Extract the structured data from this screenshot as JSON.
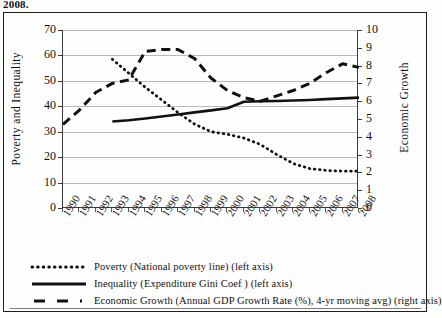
{
  "caption_tail": "2008.",
  "chart_data": {
    "type": "line",
    "title": "",
    "xlabel": "",
    "ylabel": "Poverty and Inequality",
    "y2label": "Economic Growth",
    "grid": true,
    "legend_position": "bottom",
    "x": [
      1990,
      1991,
      1992,
      1993,
      1994,
      1995,
      1996,
      1997,
      1998,
      1999,
      2000,
      2001,
      2002,
      2003,
      2004,
      2005,
      2006,
      2007,
      2008
    ],
    "xticklabels": [
      "1990",
      "1991",
      "1992",
      "1993",
      "1994",
      "1995",
      "1996",
      "1997",
      "1998",
      "1999",
      "2000",
      "2001",
      "2002",
      "2003",
      "2004",
      "2005",
      "2006",
      "2007",
      "2008"
    ],
    "ylim": [
      0,
      70
    ],
    "yticks": [
      0,
      10,
      20,
      30,
      40,
      50,
      60,
      70
    ],
    "y2lim": [
      0,
      10
    ],
    "y2ticks": [
      0,
      1,
      2,
      3,
      4,
      5,
      6,
      7,
      8,
      9,
      10
    ],
    "series": [
      {
        "name": "Poverty (National poverty line) (left axis)",
        "axis": "left",
        "style": "dotted",
        "x": [
          1993,
          1994,
          1995,
          1996,
          1997,
          1998,
          1999,
          2000,
          2001,
          2002,
          2003,
          2004,
          2005,
          2006,
          2007,
          2008
        ],
        "values": [
          58.5,
          53.0,
          47.5,
          42.5,
          37.5,
          33.0,
          30.0,
          29.0,
          27.5,
          25.0,
          21.0,
          17.5,
          15.5,
          14.8,
          14.5,
          14.5
        ]
      },
      {
        "name": "Inequality (Expenditure Gini Coef) (left axis)",
        "axis": "left",
        "style": "solid",
        "x": [
          1993,
          1994,
          1995,
          1996,
          1997,
          1998,
          1999,
          2000,
          2001,
          2002,
          2003,
          2004,
          2005,
          2006,
          2007,
          2008
        ],
        "values": [
          34.0,
          34.5,
          35.2,
          36.0,
          36.8,
          37.6,
          38.4,
          39.2,
          41.8,
          42.0,
          42.1,
          42.3,
          42.5,
          42.8,
          43.1,
          43.4
        ]
      },
      {
        "name": "Economic Growth (Annual GDP Growth Rate (%), 4-yr moving avg) (right axis)",
        "axis": "right",
        "style": "dashed",
        "x": [
          1990,
          1991,
          1992,
          1993,
          1994,
          1995,
          1996,
          1997,
          1998,
          1999,
          2000,
          2001,
          2002,
          2003,
          2004,
          2005,
          2006,
          2007,
          2008
        ],
        "values": [
          4.7,
          5.5,
          6.5,
          7.0,
          7.2,
          8.8,
          8.9,
          8.9,
          8.4,
          7.3,
          6.6,
          6.2,
          6.0,
          6.3,
          6.6,
          7.0,
          7.6,
          8.1,
          7.9
        ]
      }
    ]
  },
  "legend": [
    {
      "swatch": "dotted-line-swatch",
      "label": "Poverty (National poverty line) (left axis)"
    },
    {
      "swatch": "solid-line-swatch",
      "label": "Inequality (Expenditure Gini Coef ) (left axis)"
    },
    {
      "swatch": "dashed-line-swatch",
      "label": "Economic Growth (Annual GDP Growth Rate (%), 4-yr moving avg) (right axis)"
    }
  ]
}
